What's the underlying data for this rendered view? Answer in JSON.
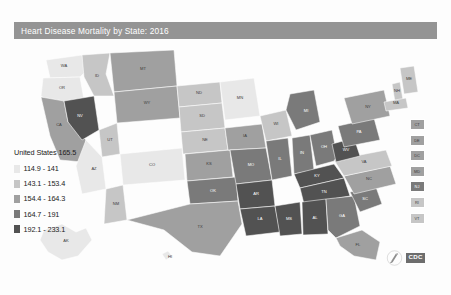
{
  "title": "Heart Disease Mortality by State: 2016",
  "legend": {
    "national_label": "United States 165.5",
    "bins": [
      {
        "label": "114.9 - 141",
        "color": "#e8e8e8"
      },
      {
        "label": "143.1 - 153.4",
        "color": "#c6c6c6"
      },
      {
        "label": "154.4 - 164.3",
        "color": "#a0a0a0"
      },
      {
        "label": "164.7 - 191",
        "color": "#7a7a7a"
      },
      {
        "label": "192.1 - 233.1",
        "color": "#525252"
      }
    ]
  },
  "colors": {
    "title_bar": "#949494",
    "background": "#fdfdfd",
    "state_border": "#ffffff"
  },
  "inset_states": [
    {
      "abbr": "CT",
      "color": "#a0a0a0"
    },
    {
      "abbr": "DE",
      "color": "#a0a0a0"
    },
    {
      "abbr": "DC",
      "color": "#a0a0a0"
    },
    {
      "abbr": "MD",
      "color": "#a0a0a0"
    },
    {
      "abbr": "NJ",
      "color": "#7a7a7a"
    },
    {
      "abbr": "RI",
      "color": "#c6c6c6"
    },
    {
      "abbr": "VT",
      "color": "#c6c6c6"
    }
  ],
  "logo": {
    "wordmark": "CDC",
    "subtext": "",
    "mark_name": "cdc-hhs-mark"
  },
  "chart_data": {
    "type": "choropleth-map",
    "title": "Heart Disease Mortality by State: 2016",
    "metric": "Heart disease mortality rate per 100,000",
    "national_value": 165.5,
    "bins": [
      "114.9 - 141",
      "143.1 - 153.4",
      "154.4 - 164.3",
      "164.7 - 191",
      "192.1 - 233.1"
    ],
    "bin_colors": [
      "#e8e8e8",
      "#c6c6c6",
      "#a0a0a0",
      "#7a7a7a",
      "#525252"
    ],
    "legend_position": "left",
    "states": [
      {
        "abbr": "WA",
        "bin": 0,
        "color": "#e8e8e8"
      },
      {
        "abbr": "OR",
        "bin": 0,
        "color": "#e8e8e8"
      },
      {
        "abbr": "CA",
        "bin": 2,
        "color": "#a0a0a0"
      },
      {
        "abbr": "NV",
        "bin": 4,
        "color": "#525252"
      },
      {
        "abbr": "ID",
        "bin": 1,
        "color": "#c6c6c6"
      },
      {
        "abbr": "MT",
        "bin": 2,
        "color": "#a0a0a0"
      },
      {
        "abbr": "WY",
        "bin": 2,
        "color": "#a0a0a0"
      },
      {
        "abbr": "UT",
        "bin": 1,
        "color": "#c6c6c6"
      },
      {
        "abbr": "AZ",
        "bin": 0,
        "color": "#e8e8e8"
      },
      {
        "abbr": "NM",
        "bin": 1,
        "color": "#c6c6c6"
      },
      {
        "abbr": "CO",
        "bin": 0,
        "color": "#e8e8e8"
      },
      {
        "abbr": "ND",
        "bin": 1,
        "color": "#c6c6c6"
      },
      {
        "abbr": "SD",
        "bin": 1,
        "color": "#c6c6c6"
      },
      {
        "abbr": "NE",
        "bin": 1,
        "color": "#c6c6c6"
      },
      {
        "abbr": "KS",
        "bin": 2,
        "color": "#a0a0a0"
      },
      {
        "abbr": "OK",
        "bin": 3,
        "color": "#7a7a7a"
      },
      {
        "abbr": "TX",
        "bin": 2,
        "color": "#a0a0a0"
      },
      {
        "abbr": "MN",
        "bin": 0,
        "color": "#e8e8e8"
      },
      {
        "abbr": "IA",
        "bin": 2,
        "color": "#a0a0a0"
      },
      {
        "abbr": "MO",
        "bin": 3,
        "color": "#7a7a7a"
      },
      {
        "abbr": "AR",
        "bin": 4,
        "color": "#525252"
      },
      {
        "abbr": "LA",
        "bin": 4,
        "color": "#525252"
      },
      {
        "abbr": "WI",
        "bin": 1,
        "color": "#c6c6c6"
      },
      {
        "abbr": "IL",
        "bin": 3,
        "color": "#7a7a7a"
      },
      {
        "abbr": "MI",
        "bin": 3,
        "color": "#7a7a7a"
      },
      {
        "abbr": "IN",
        "bin": 3,
        "color": "#7a7a7a"
      },
      {
        "abbr": "OH",
        "bin": 3,
        "color": "#7a7a7a"
      },
      {
        "abbr": "KY",
        "bin": 4,
        "color": "#525252"
      },
      {
        "abbr": "TN",
        "bin": 4,
        "color": "#525252"
      },
      {
        "abbr": "MS",
        "bin": 4,
        "color": "#525252"
      },
      {
        "abbr": "AL",
        "bin": 4,
        "color": "#525252"
      },
      {
        "abbr": "GA",
        "bin": 3,
        "color": "#7a7a7a"
      },
      {
        "abbr": "FL",
        "bin": 2,
        "color": "#a0a0a0"
      },
      {
        "abbr": "SC",
        "bin": 3,
        "color": "#7a7a7a"
      },
      {
        "abbr": "NC",
        "bin": 2,
        "color": "#a0a0a0"
      },
      {
        "abbr": "VA",
        "bin": 1,
        "color": "#c6c6c6"
      },
      {
        "abbr": "WV",
        "bin": 4,
        "color": "#525252"
      },
      {
        "abbr": "PA",
        "bin": 3,
        "color": "#7a7a7a"
      },
      {
        "abbr": "NY",
        "bin": 2,
        "color": "#a0a0a0"
      },
      {
        "abbr": "ME",
        "bin": 1,
        "color": "#c6c6c6"
      },
      {
        "abbr": "NH",
        "bin": 1,
        "color": "#c6c6c6"
      },
      {
        "abbr": "MA",
        "bin": 1,
        "color": "#c6c6c6"
      },
      {
        "abbr": "VT",
        "bin": 1,
        "color": "#c6c6c6"
      },
      {
        "abbr": "RI",
        "bin": 1,
        "color": "#c6c6c6"
      },
      {
        "abbr": "CT",
        "bin": 2,
        "color": "#a0a0a0"
      },
      {
        "abbr": "NJ",
        "bin": 3,
        "color": "#7a7a7a"
      },
      {
        "abbr": "DE",
        "bin": 2,
        "color": "#a0a0a0"
      },
      {
        "abbr": "MD",
        "bin": 2,
        "color": "#a0a0a0"
      },
      {
        "abbr": "DC",
        "bin": 2,
        "color": "#a0a0a0"
      },
      {
        "abbr": "AK",
        "bin": 0,
        "color": "#e8e8e8"
      },
      {
        "abbr": "HI",
        "bin": 0,
        "color": "#e8e8e8"
      }
    ]
  }
}
